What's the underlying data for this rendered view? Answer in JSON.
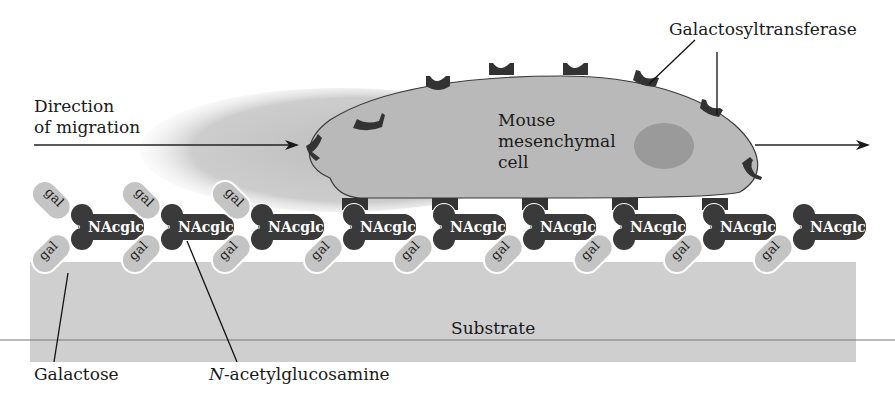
{
  "figure": {
    "labels": {
      "direction_line1": "Direction",
      "direction_line2": "of migration",
      "galactosyltransferase": "Galactosyltransferase",
      "cell_line1": "Mouse",
      "cell_line2": "mesenchymal",
      "cell_line3": "cell",
      "substrate": "Substrate",
      "galactose": "Galactose",
      "nacetyl_prefix": "N",
      "nacetyl_rest": "-acetylglucosamine"
    },
    "molecule_labels": {
      "nacglc": "NAcglc",
      "gal": "gal"
    },
    "molecules": [
      {
        "x": 78,
        "upper_gal": true,
        "bound": false
      },
      {
        "x": 168,
        "upper_gal": true,
        "bound": false
      },
      {
        "x": 258,
        "upper_gal": true,
        "bound": false
      },
      {
        "x": 350,
        "upper_gal": false,
        "bound": true
      },
      {
        "x": 440,
        "upper_gal": false,
        "bound": true
      },
      {
        "x": 530,
        "upper_gal": false,
        "bound": true
      },
      {
        "x": 620,
        "upper_gal": false,
        "bound": true
      },
      {
        "x": 710,
        "upper_gal": false,
        "bound": true
      },
      {
        "x": 800,
        "upper_gal": false,
        "bound": false
      }
    ],
    "colors": {
      "cell_fill": "#b9b9b9",
      "nucleus_fill": "#9a9a9a",
      "shadow": "#c8c8c8",
      "substrate_fill": "#cfcfcf",
      "gal_fill": "#c4c4c4",
      "nacglc_fill": "#3a3a3a",
      "receptor_fill": "#333333",
      "line": "#222222"
    }
  }
}
